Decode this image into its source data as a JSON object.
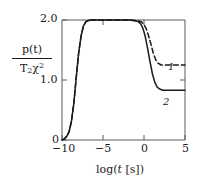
{
  "chart_data": {
    "type": "line",
    "title": "",
    "xlabel": "log(t [s])",
    "ylabel_numerator": "p(t)",
    "ylabel_denominator": "T2X^2",
    "xlim": [
      -10.5,
      5
    ],
    "ylim": [
      0,
      2.15
    ],
    "xticks": [
      -10,
      -5,
      0,
      5
    ],
    "xticklabels": [
      "−10",
      "−5",
      "0",
      "5"
    ],
    "yticks": [
      0,
      1.0,
      2.0
    ],
    "yticklabels": [
      "0",
      "1.0",
      "2.0"
    ],
    "grid": false,
    "legend": "inline-curve-labels",
    "series": [
      {
        "name": "1",
        "label": "1",
        "style": "dashed",
        "color": "#1a1a1a",
        "plateau_high": 2.0,
        "plateau_low": 1.25,
        "x": [
          -10.5,
          -10.2,
          -9.9,
          -9.6,
          -9.3,
          -9.0,
          -8.7,
          -8.4,
          -8.1,
          -7.8,
          -7.5,
          -7.0,
          -6.0,
          -5.0,
          -4.0,
          -3.0,
          -2.0,
          -1.0,
          -0.5,
          -0.2,
          0.1,
          0.4,
          0.7,
          1.0,
          1.3,
          1.6,
          2.0,
          2.5,
          3.0,
          4.0,
          5.0
        ],
        "y": [
          0.0,
          0.02,
          0.06,
          0.14,
          0.32,
          0.62,
          1.05,
          1.45,
          1.73,
          1.9,
          1.97,
          2.0,
          2.0,
          2.0,
          2.0,
          2.0,
          2.0,
          1.99,
          1.97,
          1.93,
          1.86,
          1.74,
          1.6,
          1.45,
          1.34,
          1.28,
          1.25,
          1.25,
          1.25,
          1.25,
          1.25
        ]
      },
      {
        "name": "2",
        "label": "2",
        "style": "solid",
        "color": "#1a1a1a",
        "plateau_high": 2.0,
        "plateau_low": 0.83,
        "x": [
          -10.5,
          -10.2,
          -9.9,
          -9.6,
          -9.3,
          -9.0,
          -8.7,
          -8.4,
          -8.1,
          -7.8,
          -7.5,
          -7.0,
          -6.0,
          -5.0,
          -4.0,
          -3.0,
          -2.0,
          -1.0,
          -0.6,
          -0.3,
          0.0,
          0.3,
          0.6,
          0.9,
          1.2,
          1.5,
          1.8,
          2.2,
          2.6,
          3.0,
          4.0,
          5.0
        ],
        "y": [
          0.0,
          0.02,
          0.06,
          0.14,
          0.32,
          0.62,
          1.05,
          1.45,
          1.73,
          1.9,
          1.97,
          2.0,
          2.0,
          2.0,
          2.0,
          2.0,
          2.0,
          1.98,
          1.94,
          1.86,
          1.72,
          1.52,
          1.3,
          1.1,
          0.96,
          0.88,
          0.85,
          0.83,
          0.83,
          0.83,
          0.83,
          0.83
        ]
      }
    ],
    "axis_color": "#4a4a4a",
    "curve_color": "#1a1a1a"
  },
  "labels": {
    "ylabel_num_text": "p(t)",
    "ylabel_den_main": "T",
    "ylabel_den_sub": "2",
    "ylabel_den_chi": "χ",
    "ylabel_den_sup": "2",
    "xlabel_log": "log(",
    "xlabel_t": "t",
    "xlabel_units": " [s])",
    "ytick_0": "0",
    "ytick_1": "1.0",
    "ytick_2": "2.0",
    "xtick_m10": "−10",
    "xtick_m5": "−5",
    "xtick_0": "0",
    "xtick_5": "5",
    "curve_1": "1",
    "curve_2": "2"
  }
}
